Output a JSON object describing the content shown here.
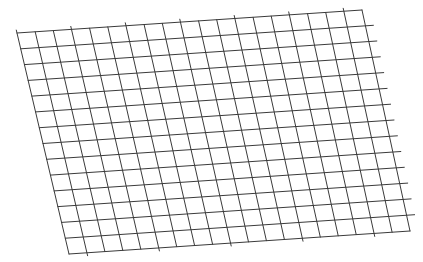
{
  "diagram": {
    "type": "perspective-grid",
    "background": "#ffffff",
    "line_color": "#3a3a3a",
    "line_width": 1,
    "corners": {
      "top_left": [
        17,
        33
      ],
      "top_right": [
        362,
        10
      ],
      "bottom_left": [
        69,
        254
      ],
      "bottom_right": [
        410,
        231
      ]
    },
    "vertical_lines": 20,
    "horizontal_lines": 15,
    "overshoot": {
      "vertical_top": 3,
      "vertical_bottom": 3,
      "horizontal_right": 8
    }
  }
}
